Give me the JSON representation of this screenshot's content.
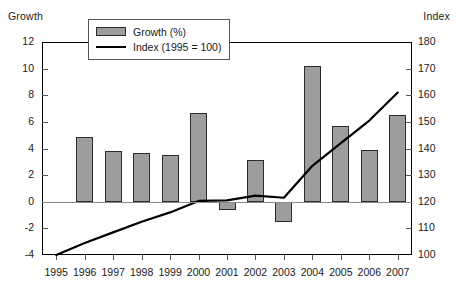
{
  "axes": {
    "left_title": "Growth",
    "right_title": "Index",
    "left_ticks": [
      "12",
      "10",
      "8",
      "6",
      "4",
      "2",
      "0",
      "-2",
      "-4"
    ],
    "right_ticks": [
      "180",
      "170",
      "160",
      "150",
      "140",
      "130",
      "120",
      "110",
      "100"
    ]
  },
  "legend": {
    "bar_label": "Growth (%)",
    "line_label": "Index  (1995 = 100)"
  },
  "chart_data": {
    "type": "bar",
    "title": "",
    "xlabel": "",
    "ylabel": "Growth",
    "y2label": "Index",
    "grid": false,
    "legend_position": "top-center",
    "categories": [
      "1995",
      "1996",
      "1997",
      "1998",
      "1999",
      "2000",
      "2001",
      "2002",
      "2003",
      "2004",
      "2005",
      "2006",
      "2007"
    ],
    "ylim": [
      -4,
      12
    ],
    "y2lim": [
      100,
      180
    ],
    "ytick_step": 2,
    "y2tick_step": 10,
    "series": [
      {
        "name": "Growth (%)",
        "type": "bar",
        "axis": "left",
        "color": "#9d9d9d",
        "edge_color": "#2b2b2b",
        "values": [
          null,
          4.9,
          3.8,
          3.65,
          3.5,
          6.7,
          -0.6,
          3.1,
          -1.5,
          10.2,
          5.7,
          3.9,
          6.5
        ]
      },
      {
        "name": "Index (1995 = 100)",
        "type": "line",
        "axis": "right",
        "color": "#000000",
        "values": [
          100,
          104.5,
          108.5,
          112.5,
          116,
          120.3,
          120.5,
          122.3,
          121.5,
          133.5,
          142,
          150.5,
          161
        ]
      }
    ]
  }
}
